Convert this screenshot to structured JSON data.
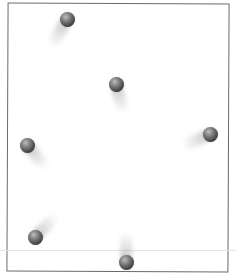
{
  "figure": {
    "frame": {
      "border_color": "#6a6a6a"
    },
    "balls": [
      {
        "id": 1,
        "cx": 67,
        "cy": 19,
        "trail_angle_deg": 30,
        "trail_length": 32
      },
      {
        "id": 2,
        "cx": 116,
        "cy": 84,
        "trail_angle_deg": -15,
        "trail_length": 30
      },
      {
        "id": 3,
        "cx": 210,
        "cy": 134,
        "trail_angle_deg": 65,
        "trail_length": 30
      },
      {
        "id": 4,
        "cx": 27,
        "cy": 145,
        "trail_angle_deg": -40,
        "trail_length": 30
      },
      {
        "id": 5,
        "cx": 35,
        "cy": 237,
        "trail_angle_deg": -135,
        "trail_length": 30
      },
      {
        "id": 6,
        "cx": 126,
        "cy": 262,
        "trail_angle_deg": 180,
        "trail_length": 30
      }
    ],
    "ball_color": "#4a4a4a"
  }
}
